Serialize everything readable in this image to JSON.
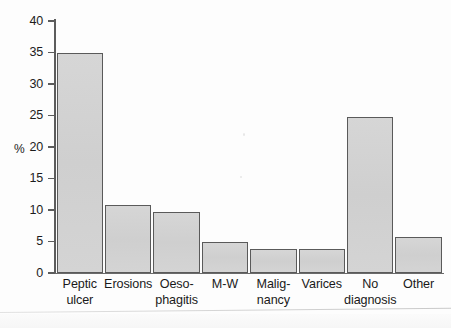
{
  "chart_data": {
    "type": "bar",
    "title": "",
    "xlabel": "",
    "ylabel": "%",
    "ylim": [
      0,
      40
    ],
    "grid": false,
    "legend": "none",
    "yticks": [
      0,
      5,
      10,
      15,
      20,
      25,
      30,
      35,
      40
    ],
    "ytick_labels": [
      "0",
      "5",
      "10",
      "15",
      "20",
      "25",
      "30",
      "35",
      "40"
    ],
    "categories": [
      "Peptic ulcer",
      "Erosions",
      "Oeso-phagitis",
      "M-W",
      "Malig-nancy",
      "Varices",
      "No diagnosis",
      "Other"
    ],
    "category_lines": [
      [
        "Peptic",
        "ulcer"
      ],
      [
        "Erosions",
        ""
      ],
      [
        "Oeso-",
        "phagitis"
      ],
      [
        "M-W",
        ""
      ],
      [
        "Malig-",
        "nancy"
      ],
      [
        "Varices",
        ""
      ],
      [
        "No",
        "diagnosis"
      ],
      [
        "Other",
        ""
      ]
    ],
    "values": [
      35.0,
      10.8,
      9.7,
      4.9,
      3.8,
      3.8,
      24.8,
      5.7
    ],
    "bar_color": "#d2d2d2",
    "bar_edge_color": "#5a5a5a",
    "axis_color": "#5c5c5c",
    "text_color": "#1a1a1a"
  }
}
